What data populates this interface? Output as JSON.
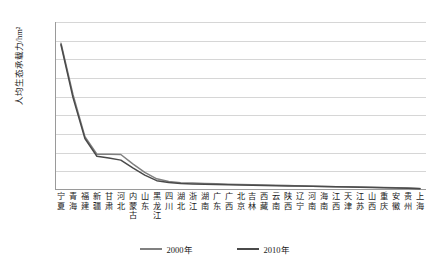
{
  "chart_data": {
    "type": "line",
    "title": "",
    "xlabel": "",
    "ylabel": "人均生态承载力/hm²",
    "ylim": [
      0,
      4500
    ],
    "ytick_step": 500,
    "grid": true,
    "legend_position": "bottom-center",
    "ytick_labels": [
      "4 500",
      "4 000",
      "3 500",
      "3 000",
      "2 500",
      "2 000",
      "1 500",
      "1 000",
      "500",
      "0"
    ],
    "ytick_values": [
      4500,
      4000,
      3500,
      3000,
      2500,
      2000,
      1500,
      1000,
      500,
      0
    ],
    "categories": [
      "宁夏",
      "青海",
      "福建",
      "新疆",
      "甘肃",
      "河北",
      "内蒙古",
      "山东",
      "黑龙江",
      "四川",
      "湖北",
      "浙江",
      "湖南",
      "广东",
      "广西",
      "北京",
      "吉林",
      "西藏",
      "云南",
      "陕西",
      "辽宁",
      "河南",
      "海南",
      "江西",
      "天津",
      "江苏",
      "山西",
      "重庆",
      "安徽",
      "贵州",
      "上海"
    ],
    "category_lines": [
      [
        "宁",
        "夏"
      ],
      [
        "青",
        "海"
      ],
      [
        "福",
        "建"
      ],
      [
        "新",
        "疆"
      ],
      [
        "甘",
        "肃"
      ],
      [
        "河",
        "北"
      ],
      [
        "内",
        "蒙",
        "古"
      ],
      [
        "山",
        "东"
      ],
      [
        "黑",
        "龙",
        "江"
      ],
      [
        "四",
        "川"
      ],
      [
        "湖",
        "北"
      ],
      [
        "浙",
        "江"
      ],
      [
        "湖",
        "南"
      ],
      [
        "广",
        "东"
      ],
      [
        "广",
        "西"
      ],
      [
        "北",
        "京"
      ],
      [
        "吉",
        "林"
      ],
      [
        "西",
        "藏"
      ],
      [
        "云",
        "南"
      ],
      [
        "陕",
        "西"
      ],
      [
        "辽",
        "宁"
      ],
      [
        "河",
        "南"
      ],
      [
        "海",
        "南"
      ],
      [
        "江",
        "西"
      ],
      [
        "天",
        "津"
      ],
      [
        "江",
        "苏"
      ],
      [
        "山",
        "西"
      ],
      [
        "重",
        "庆"
      ],
      [
        "安",
        "徽"
      ],
      [
        "贵",
        "州"
      ],
      [
        "上",
        "海"
      ]
    ],
    "series": [
      {
        "name": "2000年",
        "color": "#808080",
        "values": [
          3930,
          2560,
          1430,
          960,
          955,
          950,
          700,
          470,
          300,
          230,
          195,
          185,
          175,
          165,
          155,
          148,
          140,
          132,
          125,
          118,
          110,
          103,
          96,
          90,
          84,
          78,
          72,
          66,
          60,
          52,
          40
        ]
      },
      {
        "name": "2010年",
        "color": "#4a4a4a",
        "values": [
          3890,
          2480,
          1380,
          905,
          860,
          800,
          590,
          400,
          250,
          200,
          172,
          163,
          155,
          147,
          140,
          134,
          128,
          122,
          116,
          110,
          104,
          98,
          92,
          86,
          80,
          74,
          68,
          62,
          56,
          48,
          36
        ]
      }
    ]
  },
  "legend": {
    "items": [
      {
        "label": "2000年"
      },
      {
        "label": "2010年"
      }
    ]
  }
}
